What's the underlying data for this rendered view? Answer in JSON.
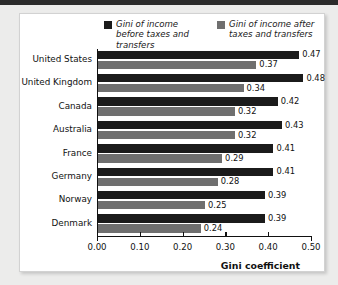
{
  "chart_data": {
    "type": "bar",
    "orientation": "horizontal",
    "title": "",
    "xlabel": "Gini coefficient",
    "ylabel": "",
    "xlim": [
      0.0,
      0.5
    ],
    "xticks": [
      "0.00",
      "0.10",
      "0.20",
      "0.30",
      "0.40",
      "0.50"
    ],
    "grid": false,
    "legend_position": "top",
    "categories": [
      "United States",
      "United Kingdom",
      "Canada",
      "Australia",
      "France",
      "Germany",
      "Norway",
      "Denmark"
    ],
    "series": [
      {
        "name": "Gini of income before taxes and transfers",
        "color": "#1b1b1b",
        "values": [
          0.47,
          0.48,
          0.42,
          0.43,
          0.41,
          0.41,
          0.39,
          0.39
        ],
        "labels": [
          "0.47",
          "0.48",
          "0.42",
          "0.43",
          "0.41",
          "0.41",
          "0.39",
          "0.39"
        ]
      },
      {
        "name": "Gini of income after taxes and transfers",
        "color": "#6f6f6f",
        "values": [
          0.37,
          0.34,
          0.32,
          0.32,
          0.29,
          0.28,
          0.25,
          0.24
        ],
        "labels": [
          "0.37",
          "0.34",
          "0.32",
          "0.32",
          "0.29",
          "0.28",
          "0.25",
          "0.24"
        ]
      }
    ]
  },
  "legend": {
    "items": [
      {
        "label": "Gini of income before taxes and transfers",
        "color": "#1b1b1b"
      },
      {
        "label": "Gini of income after taxes and transfers",
        "color": "#6f6f6f"
      }
    ]
  },
  "axis": {
    "x_title": "Gini coefficient"
  }
}
